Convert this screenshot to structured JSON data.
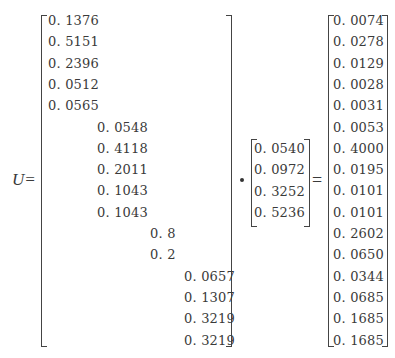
{
  "equation": {
    "lhs_label": "U=",
    "dot_operator": "·",
    "equals": "=",
    "matrix_a": {
      "columns": [
        [
          "0. 1376",
          "0. 5151",
          "0. 2396",
          "0. 0512",
          "0. 0565"
        ],
        [
          "0. 0548",
          "0. 4118",
          "0. 2011",
          "0. 1043",
          "0. 1043"
        ],
        [
          "0. 8",
          "0. 2"
        ],
        [
          "0. 0657",
          "0. 1307",
          "0. 3219",
          "0. 3219"
        ]
      ],
      "row_offsets": [
        0,
        5,
        10,
        12
      ]
    },
    "vector_w": [
      "0. 0540",
      "0. 0972",
      "0. 3252",
      "0. 5236"
    ],
    "result": [
      "0. 0074",
      "0. 0278",
      "0. 0129",
      "0. 0028",
      "0. 0031",
      "0. 0053",
      "0. 4000",
      "0. 0195",
      "0. 0101",
      "0. 0101",
      "0. 2602",
      "0. 0650",
      "0. 0344",
      "0. 0685",
      "0. 1685",
      "0. 1685"
    ]
  }
}
